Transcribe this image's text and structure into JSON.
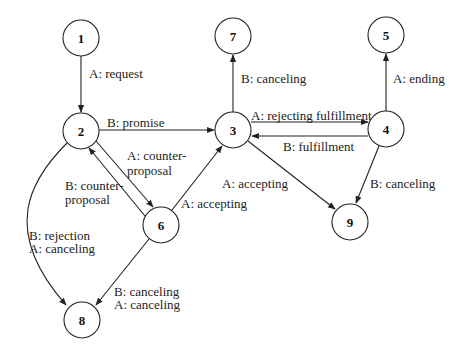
{
  "diagram": {
    "type": "state-transition",
    "nodes": [
      {
        "id": "1",
        "label": "1",
        "x": 81,
        "y": 38
      },
      {
        "id": "2",
        "label": "2",
        "x": 81,
        "y": 131
      },
      {
        "id": "3",
        "label": "3",
        "x": 233,
        "y": 130
      },
      {
        "id": "4",
        "label": "4",
        "x": 386,
        "y": 129
      },
      {
        "id": "5",
        "label": "5",
        "x": 386,
        "y": 35
      },
      {
        "id": "6",
        "label": "6",
        "x": 161,
        "y": 225
      },
      {
        "id": "7",
        "label": "7",
        "x": 233,
        "y": 36
      },
      {
        "id": "8",
        "label": "8",
        "x": 82,
        "y": 320
      },
      {
        "id": "9",
        "label": "9",
        "x": 350,
        "y": 222
      }
    ],
    "edges": [
      {
        "from": "1",
        "to": "2",
        "label": "A: request"
      },
      {
        "from": "2",
        "to": "3",
        "label": "B: promise"
      },
      {
        "from": "2",
        "to": "6",
        "label_line1": "A: counter-",
        "label_line2": "proposal"
      },
      {
        "from": "6",
        "to": "2",
        "label_line1": "B: counter-",
        "label_line2": "proposal"
      },
      {
        "from": "6",
        "to": "3",
        "label": "A: accepting"
      },
      {
        "from": "3",
        "to": "7",
        "label": "B: canceling"
      },
      {
        "from": "3",
        "to": "4",
        "label": "A: rejecting fulfillment"
      },
      {
        "from": "4",
        "to": "3",
        "label": "B: fulfillment"
      },
      {
        "from": "4",
        "to": "5",
        "label": "A: ending"
      },
      {
        "from": "3",
        "to": "9",
        "label": "A: accepting"
      },
      {
        "from": "4",
        "to": "9",
        "label": "B: canceling"
      },
      {
        "from": "2",
        "to": "8",
        "label_line1": "B: rejection",
        "label_line2": "A: canceling"
      },
      {
        "from": "6",
        "to": "8",
        "label_line1": "B: canceling",
        "label_line2": "A: canceling"
      }
    ]
  }
}
